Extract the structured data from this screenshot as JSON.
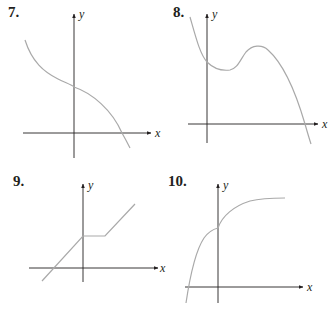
{
  "figure": {
    "panels": [
      {
        "number": "7.",
        "x_axis_label": "x",
        "y_axis_label": "y",
        "description": "Decreasing curve with inflection point at the y-intercept, concave up on the left and concave down on the right, crossing the x-axis once on the positive side"
      },
      {
        "number": "8.",
        "x_axis_label": "x",
        "y_axis_label": "y",
        "description": "Curve decreasing to a local minimum just right of the y-axis, rising to a local maximum, then decreasing and crossing the positive x-axis"
      },
      {
        "number": "9.",
        "x_axis_label": "x",
        "y_axis_label": "y",
        "description": "Piecewise linear: line of positive slope up to the y-axis, horizontal segment, then another line of the same positive slope"
      },
      {
        "number": "10.",
        "x_axis_label": "x",
        "y_axis_label": "y",
        "description": "Increasing concave-down curve with a corner at the y-axis, leveling off toward a horizontal asymptote; crosses x-axis on the negative side"
      }
    ]
  },
  "colors": {
    "axis": "#231f20",
    "curve": "#a9a9a9",
    "text": "#231f20"
  }
}
